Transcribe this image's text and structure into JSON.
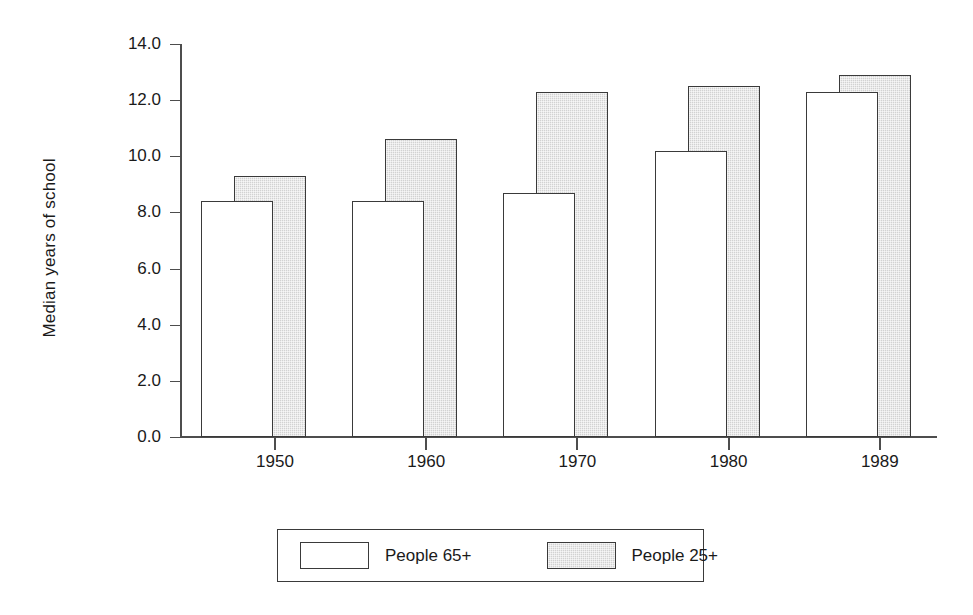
{
  "chart_data": {
    "type": "bar",
    "title": "",
    "xlabel": "",
    "ylabel": "Median years of school",
    "categories": [
      "1950",
      "1960",
      "1970",
      "1980",
      "1989"
    ],
    "series": [
      {
        "name": "People 65+",
        "values": [
          8.4,
          8.4,
          8.7,
          10.2,
          12.3
        ],
        "fill": "#ffffff"
      },
      {
        "name": "People 25+",
        "values": [
          9.3,
          10.6,
          12.3,
          12.5,
          12.9
        ],
        "fill": "#d2d2d2"
      }
    ],
    "ylim": [
      0.0,
      14.0
    ],
    "ytick_labels": [
      "0.0",
      "2.0",
      "4.0",
      "6.0",
      "8.0",
      "10.0",
      "12.0",
      "14.0"
    ],
    "ytick_values": [
      0.0,
      2.0,
      4.0,
      6.0,
      8.0,
      10.0,
      12.0,
      14.0
    ],
    "grid": false,
    "legend_position": "bottom",
    "axis_color": "#4d4d4d",
    "bar_outline_color": "#3a3a3a"
  },
  "legend": {
    "entries": [
      {
        "label": "People 65+"
      },
      {
        "label": "People 25+"
      }
    ]
  }
}
